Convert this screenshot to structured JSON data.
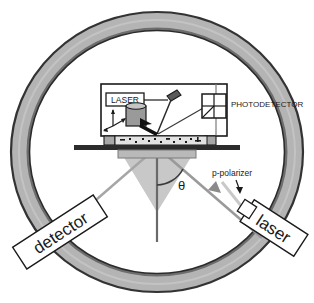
{
  "figure": {
    "name": "ellipsometer-goniometer-schematic",
    "background_color": "#ffffff"
  },
  "colors": {
    "ring_fill": "#b4b4b4",
    "ring_stroke": "#3c3c3c",
    "ring_inner_shadow": "#8f8f8f",
    "outline": "#1a1a1a",
    "beam_gray": "#9a9a9a",
    "beam_light": "#c9c9c9",
    "cone_fill": "#cfcfcf",
    "stage_fill": "#b9b9b9",
    "panel_fill": "#ffffff",
    "cylinder_fill": "#9a9a9a",
    "text": "#1a1a1a"
  },
  "ring": {
    "name": "goniometer-ring",
    "center_x": 157,
    "center_y": 152,
    "outer_rx": 147,
    "outer_ry": 141,
    "thickness": 19
  },
  "instrument": {
    "panel_label": "instrument-housing",
    "laser_box": {
      "label": "LASER"
    },
    "photodetector": {
      "label": "PHOTODETECTOR",
      "quadrants": 4
    },
    "axis_triad": {
      "label": "coordinate-axes",
      "arms": 3
    }
  },
  "sample": {
    "stage_label": "sample-stage",
    "base_label": "optical-bench"
  },
  "optics": {
    "angle_symbol": "θ",
    "normal_label": "surface-normal",
    "polarizer_label": "p-polarizer",
    "polarizer_arrow": "↓"
  },
  "arms": {
    "detector": {
      "label": "detector",
      "rotation_deg": -33
    },
    "laser": {
      "label": "laser",
      "rotation_deg": 33
    }
  }
}
